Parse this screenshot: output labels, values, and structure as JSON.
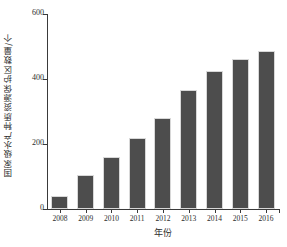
{
  "chart_data": {
    "type": "bar",
    "title": "",
    "xlabel": "年份",
    "ylabel": "国家级水产种质资源保护区数量/个",
    "categories": [
      "2008",
      "2009",
      "2010",
      "2011",
      "2012",
      "2013",
      "2014",
      "2015",
      "2016"
    ],
    "values": [
      40,
      105,
      160,
      220,
      280,
      365,
      425,
      462,
      487
    ],
    "series": [
      {
        "name": "国家级水产种质资源保护区数量",
        "values": [
          40,
          105,
          160,
          220,
          280,
          365,
          425,
          462,
          487
        ]
      }
    ],
    "ylim": [
      0,
      600
    ],
    "yticks": [
      0,
      200,
      400,
      600
    ],
    "ytick_labels": [
      "0",
      "200",
      "400",
      "600"
    ],
    "grid": false,
    "legend": false,
    "legend_position": "none",
    "bar_color": "#4d4d4d",
    "axis_color": "#3a3a3a",
    "background_color": "#ffffff"
  }
}
